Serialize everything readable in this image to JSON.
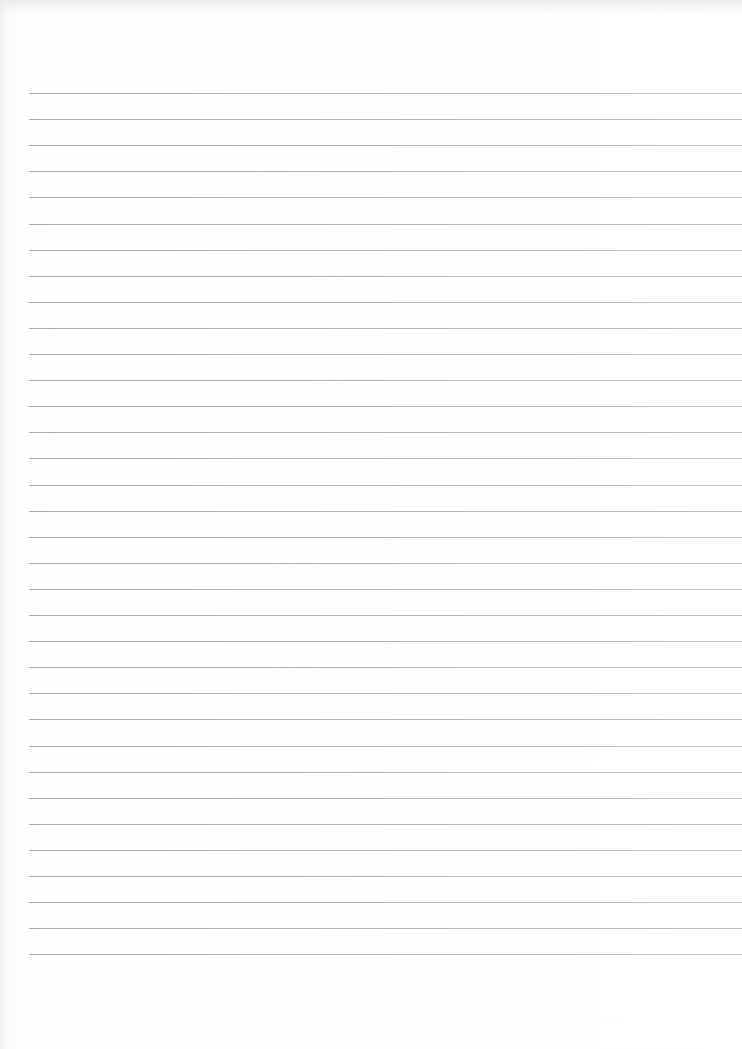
{
  "page": {
    "type": "lined-paper",
    "width": 742,
    "height": 1049,
    "background_color": "#ffffff",
    "rule_color": "#a8a8a8"
  },
  "rules": {
    "count": 34,
    "first_y": 93,
    "spacing": 26.1,
    "left_margin": 29
  },
  "content": {
    "text": ""
  }
}
